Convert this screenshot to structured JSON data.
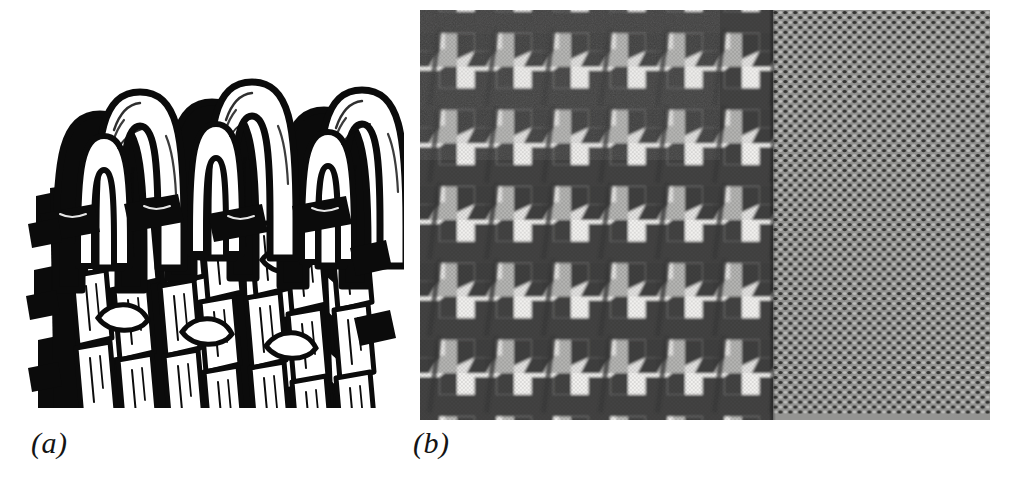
{
  "figure": {
    "background_color": "#ffffff",
    "panels": [
      {
        "id": "a",
        "label": "(a)",
        "kind": "line-illustration",
        "subject": "interlocking knitted yarn loops (weft-knit loop structure)",
        "ink_color": "#0a0a0a",
        "paper_color": "#ffffff"
      },
      {
        "id": "b",
        "label": "(b)",
        "kind": "grayscale-photograph",
        "subject": "woven fabric: houndstooth check joined to fine birdseye weave",
        "regions": [
          {
            "name": "houndstooth-check",
            "base_color": "#f2f1ef",
            "motif_color": "#2b2b2b"
          },
          {
            "name": "birdseye-weave",
            "base_color": "#949492",
            "motif_color": "#3a3a38"
          }
        ]
      }
    ]
  },
  "captions": {
    "panel_a": "(a)",
    "panel_b": "(b)"
  },
  "icons": {
    "panel_a_figure": "knit-loop-diagram-icon",
    "panel_b_figure": "fabric-swatch-photo-icon"
  }
}
